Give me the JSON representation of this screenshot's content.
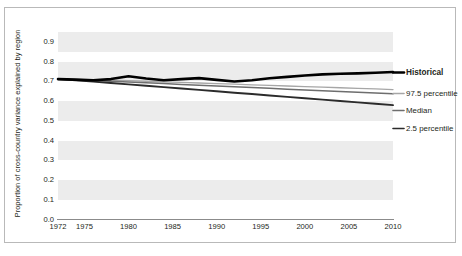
{
  "chart_data": {
    "type": "line",
    "title": "",
    "xlabel": "",
    "ylabel": "Proportion of cross-country variance explained by region",
    "xlim": [
      1972,
      2010
    ],
    "ylim": [
      0.0,
      0.95
    ],
    "grid": "horizontal-bands",
    "legend_position": "right",
    "xticks": [
      1972,
      1975,
      1980,
      1985,
      1990,
      1995,
      2000,
      2005,
      2010
    ],
    "yticks": [
      "0.0",
      "0.1",
      "0.2",
      "0.3",
      "0.4",
      "0.5",
      "0.6",
      "0.7",
      "0.8",
      "0.9"
    ],
    "x": [
      1972,
      1974,
      1976,
      1978,
      1980,
      1982,
      1984,
      1986,
      1988,
      1990,
      1992,
      1994,
      1996,
      1998,
      2000,
      2002,
      2004,
      2006,
      2008,
      2010
    ],
    "series": [
      {
        "name": "Historical",
        "color": "#000000",
        "width": 2.6,
        "values": [
          0.712,
          0.709,
          0.706,
          0.712,
          0.726,
          0.715,
          0.706,
          0.712,
          0.717,
          0.708,
          0.7,
          0.706,
          0.716,
          0.723,
          0.73,
          0.736,
          0.739,
          0.741,
          0.744,
          0.748
        ]
      },
      {
        "name": "97.5 percentile",
        "color": "#a6a6a6",
        "width": 1.3,
        "values": [
          0.712,
          0.71,
          0.708,
          0.706,
          0.704,
          0.701,
          0.698,
          0.695,
          0.692,
          0.689,
          0.686,
          0.683,
          0.68,
          0.677,
          0.674,
          0.671,
          0.668,
          0.665,
          0.662,
          0.659
        ]
      },
      {
        "name": "Median",
        "color": "#6e6e6e",
        "width": 1.5,
        "values": [
          0.712,
          0.709,
          0.705,
          0.701,
          0.697,
          0.693,
          0.689,
          0.685,
          0.681,
          0.677,
          0.673,
          0.669,
          0.665,
          0.661,
          0.657,
          0.653,
          0.649,
          0.645,
          0.641,
          0.637
        ]
      },
      {
        "name": "2.5 percentile",
        "color": "#2b2b2b",
        "width": 1.9,
        "values": [
          0.712,
          0.706,
          0.699,
          0.692,
          0.685,
          0.678,
          0.671,
          0.664,
          0.657,
          0.65,
          0.643,
          0.636,
          0.629,
          0.622,
          0.615,
          0.608,
          0.601,
          0.594,
          0.587,
          0.58
        ]
      }
    ],
    "legend": [
      {
        "label": "Historical",
        "color": "#000000",
        "bold": true
      },
      {
        "label": "97.5 percentile",
        "color": "#a6a6a6",
        "bold": false
      },
      {
        "label": "Median",
        "color": "#6e6e6e",
        "bold": false
      },
      {
        "label": "2.5 percentile",
        "color": "#2b2b2b",
        "bold": false
      }
    ],
    "bands": [
      "0.5-0.6",
      "0.6-0.7",
      "0.7-0.8",
      "0.8-0.9"
    ]
  }
}
